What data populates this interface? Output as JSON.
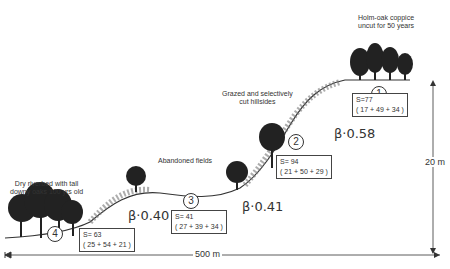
{
  "sites": [
    {
      "id": "1",
      "label": "Holm-oak coppice\nuncut for 50 years",
      "label_l1": "Holm-oak coppice",
      "label_l2": "uncut for 50 years",
      "S": "S=77",
      "breakdown": "( 17 + 49 + 34 )"
    },
    {
      "id": "2",
      "label_l1": "Grazed and selectively",
      "label_l2": "cut hillsides",
      "S": "S= 94",
      "breakdown": "( 21 + 50 + 29 )"
    },
    {
      "id": "3",
      "label_l1": "Abandoned fields",
      "S": "S= 41",
      "breakdown": "( 27 + 39 + 34 )"
    },
    {
      "id": "4",
      "label_l1": "Dry riverbed with tall",
      "label_l2": "downy oaks 100 yrs old",
      "S": "S= 63",
      "breakdown": "( 25 + 54 + 21 )"
    }
  ],
  "betas": [
    "β·0.58",
    "β·0.41",
    "β·0.40"
  ],
  "dimensions": {
    "width": "500 m",
    "height": "20 m"
  }
}
